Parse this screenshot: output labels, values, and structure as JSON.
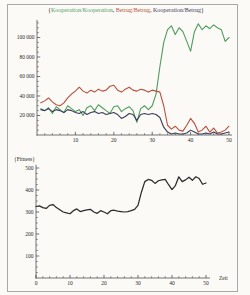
{
  "page": {
    "background": "#fbfaf7",
    "frame_border_color": "#a8a8a8"
  },
  "chart_data": [
    {
      "type": "line",
      "title": "{Kooperation/Kooperation, Betrug/Betrug, Kooperation/Betrug}",
      "title_parts": {
        "open": "{",
        "sep": ", ",
        "close": "}"
      },
      "legend_position": "top-title",
      "grid": false,
      "x_start": 1,
      "xlim": [
        0,
        50
      ],
      "ylim": [
        0,
        118000
      ],
      "x_minor_step": 2,
      "y_minor_step": 5000,
      "xticks": [
        {
          "v": 10,
          "label": "10"
        },
        {
          "v": 20,
          "label": "20"
        },
        {
          "v": 30,
          "label": "30"
        },
        {
          "v": 40,
          "label": "40"
        },
        {
          "v": 50,
          "label": "50"
        }
      ],
      "yticks": [
        {
          "v": 20000,
          "label": "20 000"
        },
        {
          "v": 40000,
          "label": "40 000"
        },
        {
          "v": 60000,
          "label": "60 000"
        },
        {
          "v": 80000,
          "label": "80 000"
        },
        {
          "v": 100000,
          "label": "100 000"
        }
      ],
      "series": [
        {
          "name": "Kooperation/Kooperation",
          "color": "#4f9d5c",
          "values": [
            27000,
            25000,
            28000,
            22000,
            29000,
            26000,
            23000,
            30000,
            27000,
            24000,
            26000,
            20000,
            28000,
            30000,
            25000,
            31000,
            28000,
            25000,
            22000,
            29000,
            30000,
            24000,
            27000,
            29000,
            25000,
            13000,
            27000,
            30000,
            26000,
            30000,
            42000,
            70000,
            95000,
            108000,
            112000,
            103000,
            110000,
            106000,
            96000,
            86000,
            106000,
            114000,
            108000,
            112000,
            109000,
            113000,
            110000,
            108000,
            96000,
            100000
          ]
        },
        {
          "name": "Betrug/Betrug",
          "color": "#b9503c",
          "values": [
            33000,
            35000,
            38000,
            34000,
            31000,
            30000,
            33000,
            38000,
            42000,
            45000,
            49000,
            45000,
            43000,
            46000,
            44000,
            47000,
            45000,
            46000,
            50000,
            51000,
            46000,
            44000,
            47000,
            49000,
            46000,
            45000,
            47000,
            46000,
            44000,
            46000,
            45000,
            44000,
            30000,
            10000,
            6000,
            9000,
            5000,
            4000,
            10000,
            17000,
            12000,
            3000,
            5000,
            9000,
            3000,
            7000,
            2000,
            3000,
            5000,
            9000
          ]
        },
        {
          "name": "Kooperation/Betrug",
          "color": "#3c3c5a",
          "values": [
            26000,
            25000,
            27000,
            24000,
            26000,
            25000,
            23000,
            26000,
            25000,
            23000,
            22000,
            24000,
            21000,
            23000,
            24000,
            22000,
            23000,
            21000,
            22000,
            23000,
            21000,
            17000,
            19000,
            22000,
            21000,
            15000,
            21000,
            22000,
            21000,
            22000,
            21000,
            18000,
            8000,
            3000,
            1000,
            2000,
            1000,
            1000,
            2000,
            5000,
            3000,
            1000,
            1000,
            2000,
            1000,
            3000,
            1000,
            1000,
            2000,
            3000
          ]
        }
      ]
    },
    {
      "type": "line",
      "ylabel": "{Fitness}",
      "xlabel": "Zeit",
      "grid": false,
      "x_start": 0,
      "xlim": [
        0,
        50
      ],
      "ylim": [
        0,
        515
      ],
      "x_minor_step": 2,
      "y_minor_step": 25,
      "xticks": [
        {
          "v": 0,
          "label": "0"
        },
        {
          "v": 10,
          "label": "10"
        },
        {
          "v": 20,
          "label": "20"
        },
        {
          "v": 30,
          "label": "30"
        },
        {
          "v": 40,
          "label": "40"
        },
        {
          "v": 50,
          "label": "50"
        }
      ],
      "yticks": [
        {
          "v": 100,
          "label": "100"
        },
        {
          "v": 200,
          "label": "200"
        },
        {
          "v": 300,
          "label": "300"
        },
        {
          "v": 400,
          "label": "400"
        },
        {
          "v": 500,
          "label": "500"
        }
      ],
      "series": [
        {
          "name": "Fitness",
          "color": "#2b2b2b",
          "values": [
            325,
            328,
            320,
            316,
            330,
            334,
            320,
            310,
            300,
            296,
            292,
            306,
            314,
            302,
            306,
            310,
            312,
            300,
            294,
            306,
            300,
            292,
            306,
            308,
            304,
            302,
            300,
            302,
            306,
            312,
            330,
            390,
            438,
            448,
            444,
            430,
            442,
            446,
            448,
            424,
            402,
            420,
            460,
            438,
            446,
            458,
            444,
            460,
            452,
            426,
            432
          ]
        }
      ]
    }
  ]
}
